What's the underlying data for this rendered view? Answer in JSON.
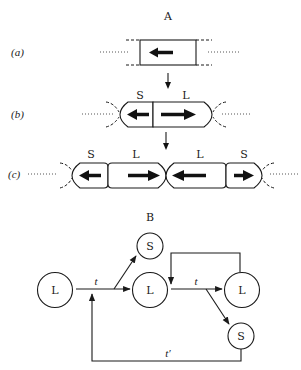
{
  "part_a": {
    "title": "A",
    "rows": [
      {
        "label": "(a)",
        "cells": [
          {
            "name": "",
            "arrow": "left"
          }
        ]
      },
      {
        "label": "(b)",
        "cells": [
          {
            "name": "S",
            "arrow": "left"
          },
          {
            "name": "L",
            "arrow": "right"
          }
        ]
      },
      {
        "label": "(c)",
        "cells": [
          {
            "name": "S",
            "arrow": "left"
          },
          {
            "name": "L",
            "arrow": "right"
          },
          {
            "name": "L",
            "arrow": "left"
          },
          {
            "name": "S",
            "arrow": "right"
          }
        ]
      }
    ]
  },
  "part_b": {
    "title": "B",
    "nodes": {
      "l_start": "L",
      "s_top": "S",
      "l_mid": "L",
      "l_right": "L",
      "s_bottom": "S"
    },
    "edges": {
      "t1": "t",
      "t2": "t",
      "t_prime": "t′"
    }
  }
}
